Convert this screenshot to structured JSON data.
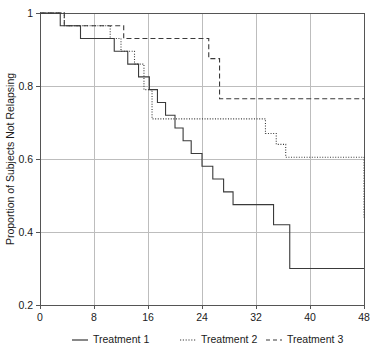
{
  "chart_data": {
    "type": "line",
    "title": "",
    "subtitle": "",
    "xlabel": "",
    "ylabel": "Proportion of Subjects Not Relapsing",
    "xlim": [
      0,
      48
    ],
    "ylim": [
      0.2,
      1.0
    ],
    "xticks": [
      0,
      8,
      16,
      24,
      32,
      40,
      48
    ],
    "xtick_labels": [
      "0",
      "8",
      "16",
      "24",
      "32",
      "40",
      "48"
    ],
    "yticks": [
      0.2,
      0.4,
      0.6,
      0.8,
      1.0
    ],
    "ytick_labels": [
      "0.2",
      "0.4",
      "0.6",
      "0.8",
      "1"
    ],
    "grid": true,
    "grid_axis": "y",
    "legend_position": "bottom",
    "step_type": "post",
    "series": [
      {
        "name": "Treatment 1",
        "dash": "solid",
        "color": "#3a3a3a",
        "x": [
          0,
          2.2,
          3.0,
          5.0,
          6.0,
          9.2,
          11.0,
          13.0,
          14.6,
          16.2,
          17.4,
          18.6,
          20.0,
          21.2,
          22.4,
          24.0,
          25.6,
          27.2,
          28.6,
          33.0,
          34.6,
          37.0,
          48
        ],
        "y": [
          1.0,
          1.0,
          0.965,
          0.965,
          0.93,
          0.93,
          0.895,
          0.86,
          0.825,
          0.79,
          0.755,
          0.72,
          0.685,
          0.65,
          0.615,
          0.58,
          0.545,
          0.51,
          0.475,
          0.475,
          0.42,
          0.3,
          0.3
        ]
      },
      {
        "name": "Treatment 2",
        "dash": "dotted",
        "color": "#3a3a3a",
        "x": [
          0,
          2.0,
          3.6,
          9.0,
          10.4,
          12.0,
          14.0,
          15.4,
          16.6,
          32.0,
          33.4,
          35.0,
          36.4,
          41.0,
          48
        ],
        "y": [
          1.0,
          1.0,
          0.965,
          0.965,
          0.93,
          0.895,
          0.86,
          0.79,
          0.71,
          0.71,
          0.67,
          0.64,
          0.605,
          0.605,
          0.44
        ]
      },
      {
        "name": "Treatment 3",
        "dash": "dashed",
        "color": "#3a3a3a",
        "x": [
          0,
          2.0,
          3.6,
          10.8,
          12.4,
          20.8,
          25.0,
          26.6,
          48
        ],
        "y": [
          1.0,
          1.0,
          0.965,
          0.965,
          0.93,
          0.93,
          0.875,
          0.765,
          0.765
        ]
      }
    ]
  },
  "legend": {
    "items": [
      {
        "label": "Treatment 1",
        "style": "solid"
      },
      {
        "label": "Treatment 2",
        "style": "dotted"
      },
      {
        "label": "Treatment 3",
        "style": "dashed"
      }
    ]
  },
  "axes": {
    "y_title": "Proportion of Subjects Not Relapsing"
  }
}
